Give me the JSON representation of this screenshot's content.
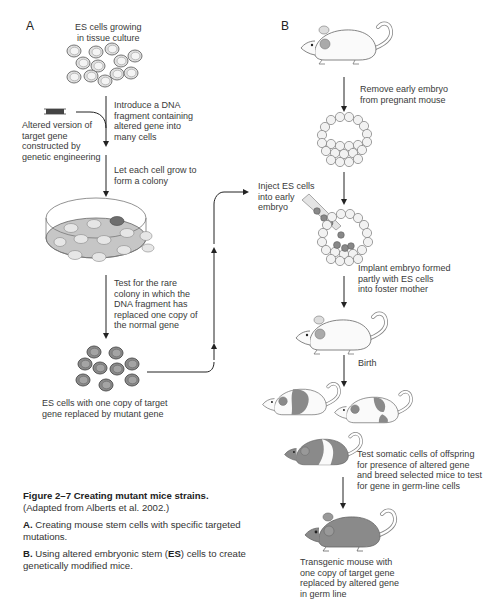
{
  "panel_a": {
    "letter": "A",
    "es_cells_label": "ES cells growing\nin tissue culture",
    "introduce_label": "Introduce a DNA\nfragment containing\naltered gene into\nmany cells",
    "altered_version_label": "Altered version of\ntarget gene\nconstructed by\ngenetic engineering",
    "colony_label": "Let each cell grow to\nform a colony",
    "test_label": "Test for the rare\ncolony in which the\nDNA fragment has\nreplaced one copy of\nthe normal gene",
    "result_label": "ES cells with one copy of target\ngene replaced by mutant gene"
  },
  "panel_b": {
    "letter": "B",
    "remove_label": "Remove early embryo\nfrom pregnant mouse",
    "inject_label": "Inject ES cells\ninto early\nembryo",
    "implant_label": "Implant embryo formed\npartly with ES cells\ninto foster mother",
    "birth_label": "Birth",
    "test_label": "Test somatic cells of offspring\nfor presence of altered gene\nand breed selected mice to test\nfor gene in germ-line cells",
    "transgenic_label": "Transgenic mouse with\none copy of target gene\nreplaced by altered gene\nin germ line"
  },
  "caption": {
    "figure_number": "Figure 2–7",
    "title": "Creating mutant mice strains.",
    "source": "(Adapted from Alberts et al. 2002.)",
    "a_letter": "A.",
    "a_text": "Creating mouse stem cells with specific targeted mutations.",
    "b_letter": "B.",
    "b_text_1": "Using altered embryonic stem (",
    "b_text_es": "ES",
    "b_text_2": ") cells to create genetically modified mice."
  },
  "colors": {
    "line": "#222222",
    "cell_fill": "#e8e8e8",
    "mutant_fill": "#8a8a8a",
    "dish_fill": "#c8c8c8",
    "dark_colony": "#6e6e6e"
  }
}
